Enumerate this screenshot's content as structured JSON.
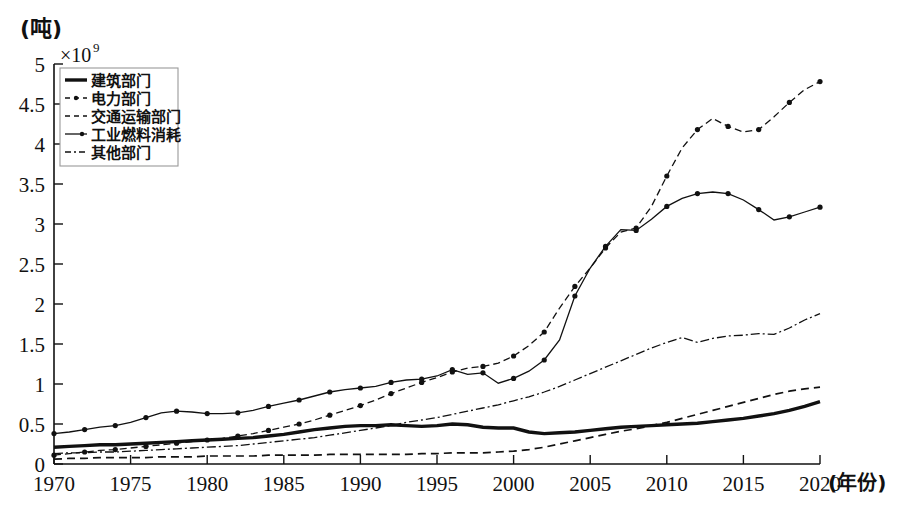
{
  "axes": {
    "y_unit_label": "(吨)",
    "y_exponent_base": "×10",
    "y_exponent_power": "9",
    "x_axis_name": "(年份)",
    "y_ticks": [
      "0",
      "0.5",
      "1",
      "1.5",
      "2",
      "2.5",
      "3",
      "3.5",
      "4",
      "4.5",
      "5"
    ],
    "x_ticks": [
      "1970",
      "1975",
      "1980",
      "1985",
      "1990",
      "1995",
      "2000",
      "2005",
      "2010",
      "2015",
      "2020"
    ]
  },
  "legend": {
    "items": [
      {
        "label": "建筑部门",
        "style": "solid-thick",
        "key": "building"
      },
      {
        "label": "电力部门",
        "style": "dashed-dotted-marker",
        "key": "power"
      },
      {
        "label": "交通运输部门",
        "style": "dashed",
        "key": "transport"
      },
      {
        "label": "工业燃料消耗",
        "style": "solid-marker",
        "key": "industry"
      },
      {
        "label": "其他部门",
        "style": "dash-dot",
        "key": "other"
      }
    ]
  },
  "chart_data": {
    "type": "line",
    "title": "",
    "xlabel": "(年份)",
    "ylabel": "(吨) ×10^9",
    "xlim": [
      1970,
      2020
    ],
    "ylim": [
      0,
      5
    ],
    "grid": false,
    "legend_position": "top-left",
    "x": [
      1970,
      1971,
      1972,
      1973,
      1974,
      1975,
      1976,
      1977,
      1978,
      1979,
      1980,
      1981,
      1982,
      1983,
      1984,
      1985,
      1986,
      1987,
      1988,
      1989,
      1990,
      1991,
      1992,
      1993,
      1994,
      1995,
      1996,
      1997,
      1998,
      1999,
      2000,
      2001,
      2002,
      2003,
      2004,
      2005,
      2006,
      2007,
      2008,
      2009,
      2010,
      2011,
      2012,
      2013,
      2014,
      2015,
      2016,
      2017,
      2018,
      2019,
      2020
    ],
    "series": [
      {
        "name": "建筑部门",
        "values": [
          0.21,
          0.22,
          0.23,
          0.24,
          0.24,
          0.25,
          0.26,
          0.27,
          0.28,
          0.29,
          0.3,
          0.31,
          0.32,
          0.33,
          0.35,
          0.37,
          0.4,
          0.43,
          0.45,
          0.47,
          0.48,
          0.48,
          0.49,
          0.48,
          0.47,
          0.48,
          0.5,
          0.49,
          0.46,
          0.45,
          0.45,
          0.4,
          0.38,
          0.39,
          0.4,
          0.42,
          0.44,
          0.46,
          0.47,
          0.48,
          0.49,
          0.5,
          0.51,
          0.53,
          0.55,
          0.57,
          0.6,
          0.63,
          0.67,
          0.72,
          0.78
        ]
      },
      {
        "name": "电力部门",
        "values": [
          0.11,
          0.13,
          0.15,
          0.17,
          0.18,
          0.2,
          0.22,
          0.24,
          0.26,
          0.28,
          0.3,
          0.32,
          0.35,
          0.38,
          0.42,
          0.46,
          0.5,
          0.55,
          0.61,
          0.67,
          0.73,
          0.8,
          0.88,
          0.95,
          1.02,
          1.08,
          1.15,
          1.2,
          1.22,
          1.26,
          1.35,
          1.48,
          1.65,
          1.95,
          2.22,
          2.45,
          2.7,
          2.9,
          2.95,
          3.22,
          3.6,
          3.95,
          4.18,
          4.32,
          4.22,
          4.15,
          4.18,
          4.34,
          4.52,
          4.68,
          4.78
        ]
      },
      {
        "name": "交通运输部门",
        "values": [
          0.06,
          0.07,
          0.07,
          0.08,
          0.08,
          0.08,
          0.08,
          0.09,
          0.09,
          0.09,
          0.1,
          0.1,
          0.1,
          0.1,
          0.11,
          0.11,
          0.11,
          0.11,
          0.12,
          0.12,
          0.12,
          0.12,
          0.12,
          0.12,
          0.13,
          0.13,
          0.14,
          0.14,
          0.14,
          0.15,
          0.16,
          0.18,
          0.21,
          0.25,
          0.29,
          0.33,
          0.37,
          0.41,
          0.44,
          0.48,
          0.52,
          0.57,
          0.62,
          0.67,
          0.72,
          0.77,
          0.82,
          0.87,
          0.91,
          0.94,
          0.96
        ]
      },
      {
        "name": "工业燃料消耗",
        "values": [
          0.38,
          0.4,
          0.43,
          0.46,
          0.48,
          0.52,
          0.58,
          0.64,
          0.66,
          0.65,
          0.63,
          0.63,
          0.64,
          0.67,
          0.72,
          0.76,
          0.8,
          0.85,
          0.9,
          0.93,
          0.95,
          0.97,
          1.02,
          1.05,
          1.06,
          1.1,
          1.18,
          1.12,
          1.14,
          1.01,
          1.07,
          1.16,
          1.3,
          1.55,
          2.1,
          2.45,
          2.72,
          2.93,
          2.92,
          3.06,
          3.22,
          3.32,
          3.38,
          3.4,
          3.38,
          3.3,
          3.18,
          3.05,
          3.09,
          3.15,
          3.21
        ]
      },
      {
        "name": "其他部门",
        "values": [
          0.13,
          0.14,
          0.14,
          0.15,
          0.15,
          0.16,
          0.17,
          0.18,
          0.19,
          0.2,
          0.21,
          0.22,
          0.23,
          0.25,
          0.27,
          0.29,
          0.31,
          0.33,
          0.36,
          0.39,
          0.42,
          0.45,
          0.48,
          0.52,
          0.55,
          0.58,
          0.62,
          0.66,
          0.7,
          0.74,
          0.79,
          0.84,
          0.9,
          0.97,
          1.05,
          1.13,
          1.21,
          1.29,
          1.37,
          1.45,
          1.52,
          1.58,
          1.52,
          1.57,
          1.6,
          1.61,
          1.63,
          1.62,
          1.7,
          1.8,
          1.88
        ]
      }
    ]
  }
}
